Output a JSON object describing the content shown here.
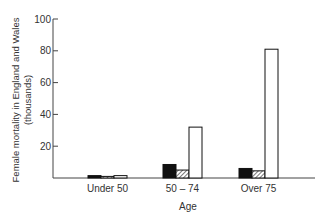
{
  "chart_data": {
    "type": "bar",
    "title": "",
    "xlabel": "Age",
    "ylabel": "Female mortality in England and Wales (thousands)",
    "ylabel_lines": [
      "Female mortality in England and Wales",
      "(thousands)"
    ],
    "ylim": [
      0,
      100
    ],
    "yticks": [
      20,
      40,
      60,
      80,
      100
    ],
    "grid": false,
    "legend": null,
    "categories": [
      "Under 50",
      "50 – 74",
      "Over 75"
    ],
    "series": [
      {
        "name": "solid black",
        "fill": "#111111",
        "values": [
          1.5,
          8.5,
          6
        ]
      },
      {
        "name": "hatched",
        "fill": "hatch",
        "values": [
          1,
          5,
          4.5
        ]
      },
      {
        "name": "white",
        "fill": "#ffffff",
        "values": [
          1.5,
          32,
          81
        ]
      }
    ]
  }
}
